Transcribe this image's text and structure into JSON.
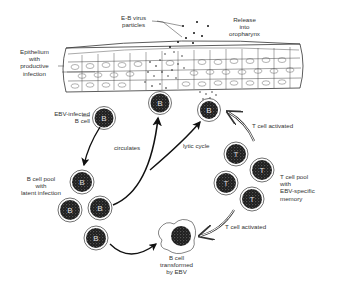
{
  "labels": {
    "virus_particles": [
      "E-B virus",
      "particles"
    ],
    "release": [
      "Release",
      "into",
      "oropharynx"
    ],
    "epithelium": [
      "Epithelium",
      "with",
      "productive",
      "infection"
    ],
    "ebv_b_cell": [
      "EBV-infected",
      "B cell"
    ],
    "circulates": "circulates",
    "lytic_cycle": "lytic cycle",
    "b_cell_pool": [
      "B cell pool",
      "with",
      "latent infection"
    ],
    "t_cell_activated_top": "T cell activated",
    "t_cell_pool": [
      "T cell pool",
      "with",
      "EBV-specific",
      "memory"
    ],
    "t_cell_activated_bottom": "T cell activated",
    "b_cell_transformed": [
      "B cell",
      "transformed",
      "by EBV"
    ]
  },
  "cell_glyphs": {
    "b": "B",
    "t": "T"
  },
  "colors": {
    "ink": "#222222",
    "cell_fill": "#2a2a2a",
    "background": "#ffffff"
  }
}
